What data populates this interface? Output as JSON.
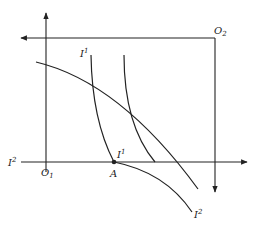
{
  "diagram": {
    "title": "",
    "colors": {
      "line": "#222222",
      "background": "#ffffff"
    },
    "labels": {
      "o1": {
        "main": "O",
        "sub": "1"
      },
      "o2": {
        "main": "O",
        "sub": "2"
      },
      "a": {
        "main": "A"
      },
      "i1_top": {
        "main": "I",
        "sup": "1"
      },
      "i1_near_a": {
        "main": "I",
        "sup": "1"
      },
      "i2_left": {
        "main": "I",
        "sup": "2"
      },
      "i2_bottom": {
        "main": "I",
        "sup": "2"
      }
    },
    "axes": {
      "origin_1": [
        46,
        162
      ],
      "origin_2": [
        215,
        38
      ],
      "horizontal_axis": {
        "from": [
          21,
          162
        ],
        "to": [
          247,
          162
        ],
        "arrow": "right"
      },
      "vertical_axis_1": {
        "from": [
          46,
          162
        ],
        "to": [
          46,
          13
        ],
        "arrow": "up"
      },
      "horizontal_axis_2": {
        "from": [
          215,
          38
        ],
        "to": [
          21,
          38
        ],
        "arrow": "left"
      },
      "vertical_axis_2": {
        "from": [
          215,
          38
        ],
        "to": [
          215,
          192
        ],
        "arrow": "down"
      }
    },
    "curves": {
      "frontier": [
        [
          36,
          62
        ],
        [
          93,
          81
        ],
        [
          130,
          108
        ],
        [
          180,
          162
        ],
        [
          198,
          189
        ]
      ],
      "indifference_1": [
        [
          91,
          55
        ],
        [
          93,
          83
        ],
        [
          100,
          130
        ],
        [
          114,
          162
        ]
      ],
      "indifference_1b": [
        [
          124,
          55
        ],
        [
          126,
          90
        ],
        [
          140,
          140
        ],
        [
          155,
          162
        ]
      ],
      "indifference_2": [
        [
          114,
          162
        ],
        [
          140,
          170
        ],
        [
          170,
          190
        ],
        [
          192,
          212
        ]
      ]
    },
    "points": {
      "a": [
        114,
        162
      ]
    }
  }
}
